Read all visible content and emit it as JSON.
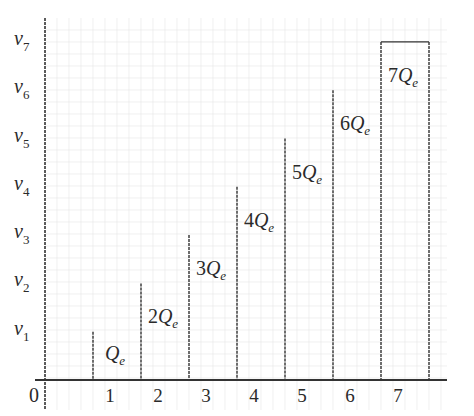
{
  "chart_data": {
    "type": "bar",
    "title": "",
    "xlabel": "",
    "ylabel": "",
    "origin_label": "0",
    "categories": [
      "1",
      "2",
      "3",
      "4",
      "5",
      "6",
      "7"
    ],
    "y_tick_labels": [
      {
        "base": "v",
        "sub": "1"
      },
      {
        "base": "v",
        "sub": "2"
      },
      {
        "base": "v",
        "sub": "3"
      },
      {
        "base": "v",
        "sub": "4"
      },
      {
        "base": "v",
        "sub": "5"
      },
      {
        "base": "v",
        "sub": "6"
      },
      {
        "base": "v",
        "sub": "7"
      }
    ],
    "values": [
      1,
      2,
      3,
      4,
      5,
      6,
      7
    ],
    "bar_labels": [
      {
        "coef": "",
        "base": "Q",
        "sub": "e"
      },
      {
        "coef": "2",
        "base": "Q",
        "sub": "e"
      },
      {
        "coef": "3",
        "base": "Q",
        "sub": "e"
      },
      {
        "coef": "4",
        "base": "Q",
        "sub": "e"
      },
      {
        "coef": "5",
        "base": "Q",
        "sub": "e"
      },
      {
        "coef": "6",
        "base": "Q",
        "sub": "e"
      },
      {
        "coef": "7",
        "base": "Q",
        "sub": "e"
      }
    ],
    "ylim": [
      0,
      7
    ],
    "grid": true,
    "style": "dashed step boundaries; staircase of bar edges, last bar fully outlined",
    "colors": {
      "line": "#333333",
      "grid": "#e6e6e6",
      "background": "#ffffff"
    }
  }
}
